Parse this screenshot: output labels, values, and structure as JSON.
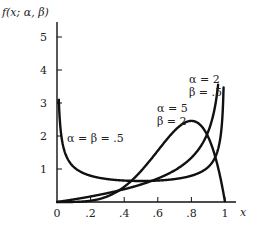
{
  "chart_data": {
    "type": "line",
    "title": "",
    "xlabel": "x",
    "ylabel": "f(x; α, β)",
    "xlim": [
      0,
      1.1
    ],
    "ylim": [
      0,
      5.3
    ],
    "grid": false,
    "legend": "inline annotations",
    "x_ticks": [
      "0",
      ".2",
      ".4",
      ".6",
      ".8",
      "1"
    ],
    "y_ticks": [
      "1",
      "2",
      "3",
      "4",
      "5"
    ],
    "series": [
      {
        "name": "α = β = .5",
        "alpha": 0.5,
        "beta": 0.5,
        "label_lines": [
          "α = β = .5"
        ]
      },
      {
        "name": "α = 5, β = 2",
        "alpha": 5,
        "beta": 2,
        "label_lines": [
          "α = 5",
          "β = 2"
        ]
      },
      {
        "name": "α = 2, β = .5",
        "alpha": 2,
        "beta": 0.5,
        "label_lines": [
          "α = 2",
          "β = .5"
        ]
      }
    ]
  },
  "labels": {
    "ylabel": "f(x; α, β)",
    "xlabel": "x",
    "s1": "α = β = .5",
    "s2a": "α = 5",
    "s2b": "β = 2",
    "s3a": "α = 2",
    "s3b": "β = .5"
  }
}
